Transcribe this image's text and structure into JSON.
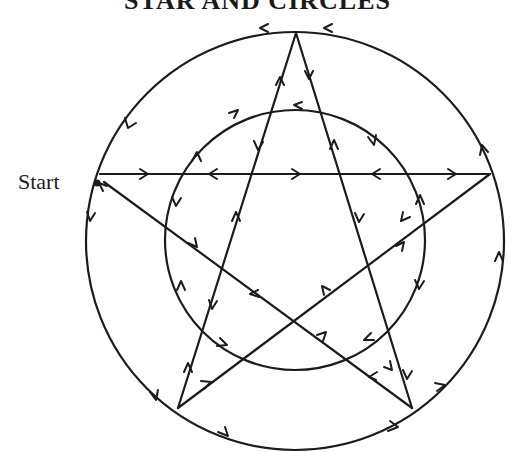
{
  "diagram": {
    "title": "STAR AND CIRCLES",
    "start_label": "Start",
    "colors": {
      "stroke": "#1c1c1c",
      "background": "#ffffff"
    },
    "shapes": {
      "outer_circle": {
        "cx": 295,
        "cy": 241,
        "r": 209
      },
      "inner_circle": {
        "cx": 295,
        "cy": 240,
        "r": 130
      },
      "star_vertices": {
        "top": [
          296,
          33
        ],
        "right": [
          490,
          174
        ],
        "bottom_right": [
          412,
          408
        ],
        "bottom_left": [
          178,
          408
        ],
        "left": [
          97,
          182
        ]
      },
      "start_point": [
        97,
        182
      ]
    }
  }
}
